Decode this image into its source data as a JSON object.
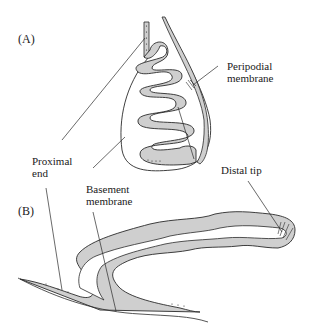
{
  "panels": [
    {
      "id": "A",
      "label": "(A)"
    },
    {
      "id": "B",
      "label": "(B)"
    }
  ],
  "labels": {
    "peripodial_membrane": "Peripodial\nmembrane",
    "proximal_end": "Proximal\nend",
    "basement_membrane": "Basement\nmembrane",
    "distal_tip": "Distal tip"
  },
  "colors": {
    "epithelium_fill": "#cfcfcf",
    "outline": "#2a2a2a",
    "background": "#ffffff"
  }
}
